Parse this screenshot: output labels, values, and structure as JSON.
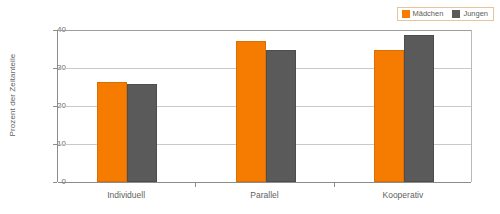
{
  "chart_data": {
    "type": "bar",
    "title": "",
    "subtitle": "",
    "xlabel": "",
    "ylabel": "Prozent der Zeitanteile",
    "categories": [
      "Individuell",
      "Parallel",
      "Kooperativ"
    ],
    "series": [
      {
        "name": "Mädchen",
        "color": "#f57c00",
        "values": [
          26.4,
          37.2,
          34.8
        ]
      },
      {
        "name": "Jungen",
        "color": "#5a5a5a",
        "values": [
          25.7,
          34.8,
          38.7
        ]
      }
    ],
    "ylim": [
      0,
      40
    ],
    "yticks": [
      0,
      10,
      20,
      30,
      40
    ],
    "ytick_labels": [
      "0",
      "10",
      "20",
      "30",
      "40"
    ],
    "grid": true,
    "legend_position": "top-right"
  },
  "legend": {
    "entries": [
      {
        "label": "Mädchen",
        "color": "#f57c00",
        "swatch_name": "legend-swatch-madchen"
      },
      {
        "label": "Jungen",
        "color": "#5a5a5a",
        "swatch_name": "legend-swatch-jungen"
      }
    ]
  },
  "axes": {
    "y_title": "Prozent der Zeitanteile",
    "y_ticks": [
      "40",
      "30",
      "20",
      "10",
      "0"
    ],
    "x_ticks": [
      "Individuell",
      "Parallel",
      "Kooperativ"
    ]
  },
  "colors": {
    "madchen": "#f57c00",
    "jungen": "#5a5a5a",
    "grid": "#c9c9c9",
    "axis": "#8c8c8c",
    "legend_border": "#e8c49a",
    "text": "#636363",
    "background": "#ffffff"
  }
}
